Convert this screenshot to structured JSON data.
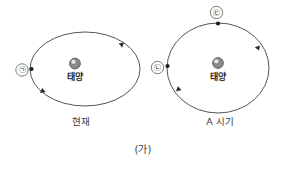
{
  "figure": {
    "caption": "(가)",
    "background_color": "#ffffff",
    "stroke_color": "#555555",
    "node_color": "#1c1c1c",
    "sun_color": "#8a8a8a"
  },
  "panels": [
    {
      "id": "present",
      "caption": "현재",
      "orbit_shape": "ellipse",
      "sun_label": "태양",
      "markers": [
        {
          "id": "marker-a",
          "label": "㉠",
          "position": "left"
        }
      ],
      "arrows": [
        {
          "id": "arrow-upper-right",
          "direction": "counterclockwise"
        },
        {
          "id": "arrow-lower-left",
          "direction": "counterclockwise"
        }
      ]
    },
    {
      "id": "period-a",
      "caption": "A 시기",
      "orbit_shape": "circle",
      "sun_label": "태양",
      "markers": [
        {
          "id": "marker-b",
          "label": "㉡",
          "position": "left"
        },
        {
          "id": "marker-c",
          "label": "㉢",
          "position": "top"
        }
      ],
      "arrows": [
        {
          "id": "arrow-upper-right",
          "direction": "counterclockwise"
        },
        {
          "id": "arrow-lower-left",
          "direction": "counterclockwise"
        }
      ]
    }
  ]
}
